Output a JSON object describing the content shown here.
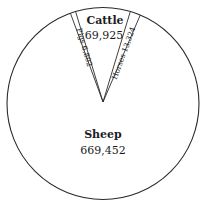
{
  "chart_data": {
    "type": "pie",
    "title": "",
    "colors": {
      "stroke": "#2a2a2a",
      "fill": "#ffffff",
      "text": "#1c1c1c"
    },
    "slices": [
      {
        "name": "Pigs",
        "value": 6802,
        "display": "6,802",
        "label": "Pigs 6,802"
      },
      {
        "name": "Cattle",
        "value": 69925,
        "display": "69,925",
        "label": "Cattle"
      },
      {
        "name": "Horses",
        "value": 13324,
        "display": "13,324",
        "label": "Horses 13,324"
      },
      {
        "name": "Sheep",
        "value": 669452,
        "display": "669,452",
        "label": "Sheep"
      }
    ],
    "categories": [
      "Pigs",
      "Cattle",
      "Horses",
      "Sheep"
    ],
    "values": [
      6802,
      69925,
      13324,
      669452
    ],
    "legend": "none (labels inside slices)"
  },
  "labels": {
    "cattle_name": "Cattle",
    "cattle_value": "69,925",
    "sheep_name": "Sheep",
    "sheep_value": "669,452",
    "pigs_text": "Pigs 6,802",
    "horses_text": "Horses 13,324"
  }
}
